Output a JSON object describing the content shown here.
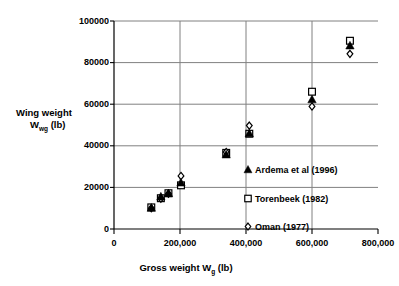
{
  "chart_data": {
    "type": "scatter",
    "title": "",
    "xlabel": "Gross weight Wg (lb)",
    "xlabel_main": "Gross weight W",
    "xlabel_sub": "g",
    "xlabel_unit": " (lb)",
    "ylabel": "Wing weight Wwg (lb)",
    "ylabel_line1": "Wing weight",
    "ylabel_line2_main": "W",
    "ylabel_line2_sub": "wg",
    "ylabel_line2_unit": " (lb)",
    "xlim": [
      0,
      800000
    ],
    "ylim": [
      0,
      100000
    ],
    "grid": true,
    "legend_position": "inside-right",
    "xticks": [
      0,
      200000,
      400000,
      600000,
      800000
    ],
    "xtick_labels": [
      "0",
      "200,000",
      "400,000",
      "600,000",
      "800,000"
    ],
    "yticks": [
      0,
      20000,
      40000,
      60000,
      80000,
      100000
    ],
    "ytick_labels": [
      "0",
      "20000",
      "40000",
      "60000",
      "80000",
      "100000"
    ],
    "series": [
      {
        "name": "Ardema et al (1996)",
        "marker": "filled-triangle",
        "color": "#000000",
        "points": [
          {
            "x": 113000,
            "y": 10200
          },
          {
            "x": 142000,
            "y": 15600
          },
          {
            "x": 165000,
            "y": 17200
          },
          {
            "x": 203000,
            "y": 22300
          },
          {
            "x": 340000,
            "y": 35800
          },
          {
            "x": 410000,
            "y": 46000
          },
          {
            "x": 600000,
            "y": 62300
          },
          {
            "x": 715000,
            "y": 88200
          }
        ]
      },
      {
        "name": "Torenbeek (1982)",
        "marker": "open-square",
        "color": "#000000",
        "points": [
          {
            "x": 113000,
            "y": 10400
          },
          {
            "x": 142000,
            "y": 14800
          },
          {
            "x": 165000,
            "y": 17200
          },
          {
            "x": 203000,
            "y": 21000
          },
          {
            "x": 340000,
            "y": 36600
          },
          {
            "x": 410000,
            "y": 45800
          },
          {
            "x": 600000,
            "y": 66000
          },
          {
            "x": 715000,
            "y": 90500
          }
        ]
      },
      {
        "name": "Oman (1977)",
        "marker": "open-diamond",
        "color": "#000000",
        "points": [
          {
            "x": 113000,
            "y": 10000
          },
          {
            "x": 142000,
            "y": 14600
          },
          {
            "x": 165000,
            "y": 17000
          },
          {
            "x": 203000,
            "y": 25500
          },
          {
            "x": 340000,
            "y": 37000
          },
          {
            "x": 410000,
            "y": 49700
          },
          {
            "x": 600000,
            "y": 58900
          },
          {
            "x": 715000,
            "y": 84200
          }
        ]
      }
    ]
  },
  "legend": {
    "items": [
      {
        "label": "Ardema et al (1996)",
        "marker": "filled-triangle"
      },
      {
        "label": "Torenbeek (1982)",
        "marker": "open-square"
      },
      {
        "label": "Oman (1977)",
        "marker": "open-diamond"
      }
    ]
  },
  "axes": {
    "x_title_main": "Gross weight W",
    "x_title_sub": "g",
    "x_title_unit": " (lb)",
    "y_title_line1": "Wing weight",
    "y_title_line2_main": "W",
    "y_title_line2_sub": "wg",
    "y_title_line2_unit": " (lb)"
  },
  "colors": {
    "marker": "#000000",
    "grid": "#808080",
    "axis": "#000000",
    "background": "#ffffff"
  }
}
